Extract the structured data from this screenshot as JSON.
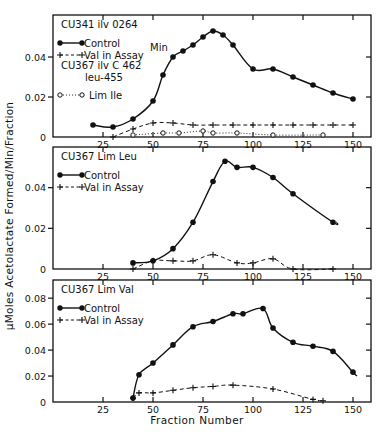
{
  "figure": {
    "ylabel": "μMoles Acetolactate Formed/Min/Fraction",
    "xlabel": "Fraction Number"
  },
  "chart_data": [
    {
      "type": "line",
      "panel": "top",
      "title_lines": [
        "CU341  ilv 0264"
      ],
      "annotation": "Min",
      "extra_label_lines": [
        "CU367  ilv C 462",
        "leu-455"
      ],
      "xlabel": "",
      "ylabel": "μMoles Acetolactate Formed/Min/Fraction",
      "xlim": [
        0,
        159
      ],
      "ylim": [
        0,
        0.061
      ],
      "xticks": [
        25,
        50,
        75,
        100,
        125,
        150
      ],
      "yticks": [
        0,
        0.02,
        0.04
      ],
      "ytick_labels": [
        "0",
        "0.02",
        "0.04"
      ],
      "series": [
        {
          "name": "Control",
          "style": "solid-dot",
          "x": [
            20,
            30,
            40,
            50,
            55,
            60,
            65,
            70,
            75,
            80,
            85,
            90,
            100,
            110,
            120,
            130,
            140,
            150
          ],
          "y": [
            0.006,
            0.005,
            0.009,
            0.018,
            0.031,
            0.04,
            0.043,
            0.046,
            0.05,
            0.053,
            0.051,
            0.046,
            0.034,
            0.034,
            0.03,
            0.026,
            0.022,
            0.019
          ]
        },
        {
          "name": "Val in Assay",
          "style": "dashed-plus",
          "x": [
            30,
            40,
            50,
            60,
            70,
            80,
            90,
            100,
            110,
            120,
            130,
            140,
            150
          ],
          "y": [
            0.0,
            0.004,
            0.007,
            0.007,
            0.006,
            0.006,
            0.006,
            0.006,
            0.006,
            0.006,
            0.006,
            0.006,
            0.006
          ]
        },
        {
          "name": "Lim Ile",
          "style": "dotted-circle",
          "x": [
            40,
            55,
            63,
            75,
            80,
            92,
            110,
            135
          ],
          "y": [
            0.001,
            0.002,
            0.002,
            0.003,
            0.002,
            0.002,
            0.001,
            0.001
          ]
        }
      ]
    },
    {
      "type": "line",
      "panel": "middle",
      "title_lines": [
        "CU367  Lim Leu"
      ],
      "xlim": [
        0,
        159
      ],
      "ylim": [
        0,
        0.06
      ],
      "xticks": [
        25,
        50,
        75,
        100,
        125,
        150
      ],
      "yticks": [
        0,
        0.02,
        0.04
      ],
      "ytick_labels": [
        "0",
        "0.02",
        "0.04"
      ],
      "series": [
        {
          "name": "Control",
          "style": "solid-dot",
          "x": [
            40,
            50,
            60,
            70,
            80,
            86,
            92,
            100,
            110,
            120,
            140,
            142
          ],
          "y": [
            0.003,
            0.004,
            0.01,
            0.023,
            0.043,
            0.053,
            0.05,
            0.05,
            0.045,
            0.037,
            0.023,
            0.023
          ]
        },
        {
          "name": "Val in Assay",
          "style": "dashed-plus",
          "x": [
            40,
            50,
            60,
            70,
            80,
            92,
            100,
            110,
            120,
            140
          ],
          "y": [
            0.0,
            0.004,
            0.004,
            0.004,
            0.007,
            0.003,
            0.003,
            0.005,
            0.0,
            0.0
          ]
        }
      ]
    },
    {
      "type": "line",
      "panel": "bottom",
      "title_lines": [
        "CU367  Lim Val"
      ],
      "xlabel": "Fraction Number",
      "xlim": [
        0,
        159
      ],
      "ylim": [
        0,
        0.094
      ],
      "xticks": [
        25,
        50,
        75,
        100,
        125,
        150
      ],
      "yticks": [
        0,
        0.02,
        0.04,
        0.06,
        0.08
      ],
      "ytick_labels": [
        "0",
        "0.02",
        "0.04",
        "0.06",
        "0.08"
      ],
      "series": [
        {
          "name": "Control",
          "style": "solid-dot",
          "x": [
            40,
            43,
            50,
            60,
            70,
            80,
            90,
            95,
            105,
            110,
            120,
            130,
            140,
            150,
            152
          ],
          "y": [
            0.003,
            0.021,
            0.03,
            0.044,
            0.058,
            0.062,
            0.068,
            0.068,
            0.072,
            0.057,
            0.046,
            0.043,
            0.039,
            0.023,
            0.02
          ]
        },
        {
          "name": "Val in Assay",
          "style": "dashed-plus",
          "x": [
            40,
            43,
            50,
            60,
            70,
            80,
            90,
            110,
            130,
            135
          ],
          "y": [
            0.003,
            0.007,
            0.007,
            0.009,
            0.011,
            0.012,
            0.013,
            0.01,
            0.002,
            0.001
          ]
        }
      ]
    }
  ]
}
